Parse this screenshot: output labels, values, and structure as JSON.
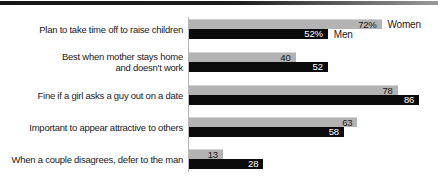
{
  "colors": {
    "women_bar": "#b3b3b3",
    "men_bar": "#0a0a0a",
    "axis": "#b5b5b5",
    "top_rule": "#161616",
    "value_on_gray": "#1a1a1a",
    "value_on_black": "#ffffff"
  },
  "chart_data": {
    "type": "bar",
    "orientation": "horizontal",
    "title": "",
    "xlabel": "",
    "ylabel": "",
    "xlim": [
      0,
      93
    ],
    "grid": false,
    "legend_position": "inline-first-row",
    "categories": [
      "Plan to take time off to raise children",
      "Best when mother stays home\nand doesn't work",
      "Fine if a girl asks a guy out on a date",
      "Important to appear attractive to others",
      "When a couple disagrees, defer to the man"
    ],
    "series": [
      {
        "name": "Women",
        "color": "#b3b3b3",
        "label_color": "#1a1a1a",
        "values": [
          72,
          40,
          78,
          63,
          13
        ],
        "labels": [
          "72%",
          "40",
          "78",
          "63",
          "13"
        ]
      },
      {
        "name": "Men",
        "color": "#0a0a0a",
        "label_color": "#ffffff",
        "values": [
          52,
          52,
          86,
          58,
          28
        ],
        "labels": [
          "52%",
          "52",
          "86",
          "58",
          "28"
        ]
      }
    ]
  }
}
